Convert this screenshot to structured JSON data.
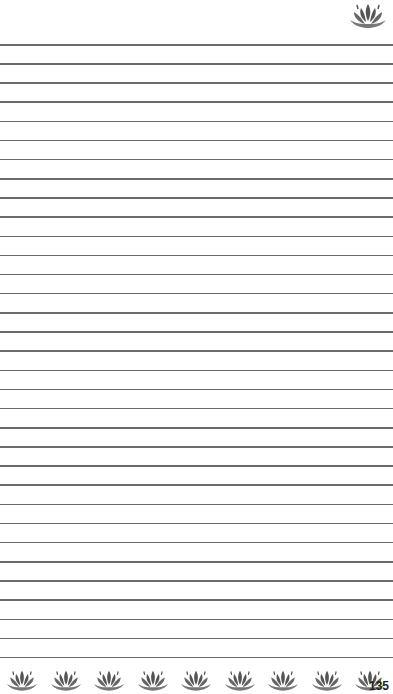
{
  "page": {
    "type": "lined-notebook-page",
    "page_number": "135",
    "line_count": 33,
    "line_start_y": 44,
    "line_spacing": 19.15,
    "line_color": "#6a6a6a",
    "decoration": {
      "top_right_icon": "lotus-icon",
      "footer_icon": "lotus-icon",
      "footer_icon_count": 9,
      "icon_color": "#555555"
    }
  }
}
